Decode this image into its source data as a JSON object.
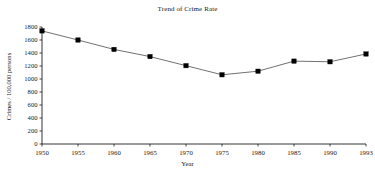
{
  "chart_data": {
    "type": "line",
    "title": "Trend of Crime Rate",
    "xlabel": "Year",
    "ylabel": "Crimes / 100,000 persons",
    "categories": [
      "1950",
      "1955",
      "1960",
      "1965",
      "1970",
      "1975",
      "1980",
      "1985",
      "1990",
      "1993"
    ],
    "x": [
      1950,
      1955,
      1960,
      1965,
      1970,
      1975,
      1980,
      1985,
      1990,
      1993
    ],
    "values": [
      1740,
      1600,
      1455,
      1345,
      1205,
      1065,
      1120,
      1275,
      1265,
      1385
    ],
    "series": [
      {
        "name": "Crime Rate",
        "values": [
          1740,
          1600,
          1455,
          1345,
          1205,
          1065,
          1120,
          1275,
          1265,
          1385
        ]
      }
    ],
    "ylim": [
      0,
      1800
    ],
    "yticks": [
      0,
      200,
      400,
      600,
      800,
      1000,
      1200,
      1400,
      1600,
      1800
    ],
    "ytick_labels": [
      "0",
      "200",
      "400",
      "600",
      "800",
      "1000",
      "1200",
      "1400",
      "1600",
      "1800"
    ],
    "xtick_labels": [
      "1950",
      "1955",
      "1960",
      "1965",
      "1970",
      "1975",
      "1980",
      "1985",
      "1990",
      "1993"
    ],
    "grid": false,
    "legend": false,
    "legend_position": "none",
    "marker": "filled-square",
    "line_color": "#333333",
    "marker_color": "#000000",
    "background_color": "#ffffff"
  }
}
